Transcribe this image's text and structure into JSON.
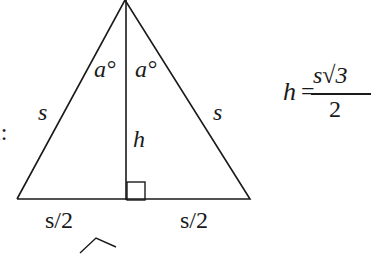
{
  "diagram": {
    "type": "equilateral-triangle-altitude",
    "left_label_fragment": "l:",
    "side_left_label": "s",
    "side_right_label": "s",
    "angle_left_label": "a°",
    "angle_right_label": "a°",
    "altitude_label": "h",
    "base_left_label": "s/2",
    "base_right_label": "s/2",
    "formula": {
      "lhs": "h",
      "equals": "=",
      "numerator": "s√3",
      "denominator": "2"
    },
    "colors": {
      "stroke": "#1a1a1a",
      "background": "#ffffff"
    }
  }
}
